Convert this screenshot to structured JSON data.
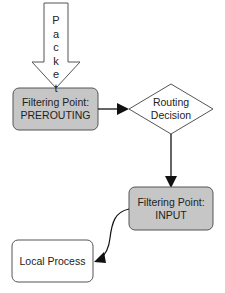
{
  "diagram": {
    "packet_arrow": {
      "label_letters": [
        "P",
        "a",
        "c",
        "k",
        "e",
        "t"
      ],
      "label": "Packet"
    },
    "nodes": {
      "prerouting": {
        "line1": "Filtering Point:",
        "line2": "PREROUTING",
        "fill": "#c8c8c8"
      },
      "routing": {
        "line1": "Routing",
        "line2": "Decision",
        "fill": "#ffffff"
      },
      "input": {
        "line1": "Filtering Point:",
        "line2": "INPUT",
        "fill": "#c8c8c8"
      },
      "local": {
        "line1": "Local Process",
        "fill": "#ffffff"
      }
    },
    "edges": [
      {
        "from": "packet",
        "to": "prerouting"
      },
      {
        "from": "prerouting",
        "to": "routing"
      },
      {
        "from": "routing",
        "to": "input"
      },
      {
        "from": "input",
        "to": "local"
      }
    ]
  }
}
